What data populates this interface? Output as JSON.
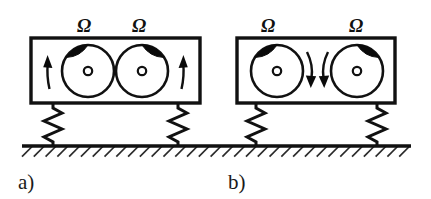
{
  "figure": {
    "background_color": "#ffffff",
    "ink_color": "#111111",
    "mass_color": "#0a0a0a",
    "panels": [
      {
        "id": "a",
        "label": "a)",
        "label_x": 18,
        "label_y": 189,
        "box": {
          "x": 31,
          "y": 38,
          "width": 169,
          "height": 65
        },
        "rotation_labels": [
          {
            "text": "Ω",
            "x": 84,
            "y": 32
          },
          {
            "text": "Ω",
            "x": 139,
            "y": 32
          }
        ],
        "rotors": [
          {
            "name": "left-rotor",
            "cx": 88,
            "cy": 71,
            "r": 26,
            "hub_r": 4.2,
            "unbalance_angle_deg": 305,
            "spin_direction": "counter-clockwise"
          },
          {
            "name": "right-rotor",
            "cx": 142,
            "cy": 71,
            "r": 26,
            "hub_r": 4.2,
            "unbalance_angle_deg": 235,
            "spin_direction": "clockwise"
          }
        ],
        "arrows": [
          {
            "name": "left-rotation-arrow",
            "x": 48,
            "y": 71,
            "direction": "up",
            "placement": "outboard-left"
          },
          {
            "name": "right-rotation-arrow",
            "x": 183,
            "y": 71,
            "direction": "up",
            "placement": "outboard-right"
          }
        ],
        "springs": [
          {
            "name": "left-spring",
            "x": 53,
            "top": 103,
            "bottom": 145,
            "zigzags": 4,
            "amplitude": 9
          },
          {
            "name": "right-spring",
            "x": 178,
            "top": 103,
            "bottom": 145,
            "zigzags": 4,
            "amplitude": 9
          }
        ]
      },
      {
        "id": "b",
        "label": "b)",
        "label_x": 228,
        "label_y": 189,
        "box": {
          "x": 237,
          "y": 38,
          "width": 158,
          "height": 65
        },
        "rotation_labels": [
          {
            "text": "Ω",
            "x": 268,
            "y": 32
          },
          {
            "text": "Ω",
            "x": 356,
            "y": 32
          }
        ],
        "rotors": [
          {
            "name": "left-rotor",
            "cx": 277,
            "cy": 71,
            "r": 26,
            "hub_r": 4.2,
            "unbalance_angle_deg": 305,
            "spin_direction": "clockwise"
          },
          {
            "name": "right-rotor",
            "cx": 357,
            "cy": 71,
            "r": 26,
            "hub_r": 4.2,
            "unbalance_angle_deg": 235,
            "spin_direction": "counter-clockwise"
          }
        ],
        "arrows": [
          {
            "name": "left-rotation-arrow",
            "x": 311,
            "y": 71,
            "direction": "down",
            "placement": "inboard-left"
          },
          {
            "name": "right-rotation-arrow",
            "x": 324,
            "y": 71,
            "direction": "down",
            "placement": "inboard-right"
          }
        ],
        "springs": [
          {
            "name": "left-spring",
            "x": 256,
            "top": 103,
            "bottom": 145,
            "zigzags": 4,
            "amplitude": 9
          },
          {
            "name": "right-spring",
            "x": 377,
            "top": 103,
            "bottom": 145,
            "zigzags": 4,
            "amplitude": 9
          }
        ]
      }
    ],
    "ground": {
      "name": "fixed-ground",
      "x_start": 22,
      "x_end": 411,
      "y": 146,
      "hatch_count": 33,
      "hatch_length": 15,
      "hatch_angle_deg": 45
    }
  }
}
